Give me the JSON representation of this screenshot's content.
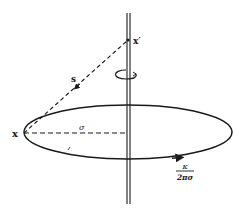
{
  "figure": {
    "labels": {
      "point_x": "x",
      "point_x_prime": "x′",
      "distance": "s",
      "radius": "σ",
      "velocity_numerator": "κ",
      "velocity_denominator": "2πσ"
    },
    "colors": {
      "ink": "#1a1a1a",
      "background": "#ffffff"
    }
  }
}
